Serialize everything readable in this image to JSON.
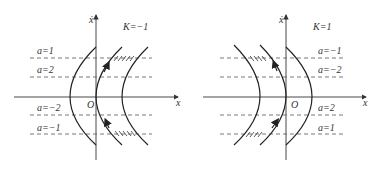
{
  "panels": [
    {
      "id": "left",
      "k_label": "K=−1",
      "axis_x_label": "x",
      "axis_y_label": "ẋ",
      "origin_label": "O",
      "a_labels_above": [
        "a=1",
        "a=2"
      ],
      "a_labels_below": [
        "a=−2",
        "a=−1"
      ]
    },
    {
      "id": "right",
      "k_label": "K=1",
      "axis_x_label": "x",
      "axis_y_label": "ẋ",
      "origin_label": "O",
      "a_labels_above": [
        "a=−1",
        "a=−2"
      ],
      "a_labels_below": [
        "a=2",
        "a=1"
      ]
    }
  ],
  "colors": {
    "line": "#222222",
    "dash": "#555555",
    "text": "#333333"
  }
}
